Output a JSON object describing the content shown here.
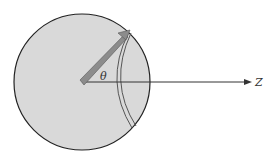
{
  "diagram": {
    "labels": {
      "angle": "θ",
      "axis": "Z"
    },
    "colors": {
      "disk_fill": "#d9d9d9",
      "disk_stroke": "#222222",
      "arrow_fill": "#8c8c8c",
      "axis_stroke": "#333333"
    }
  }
}
